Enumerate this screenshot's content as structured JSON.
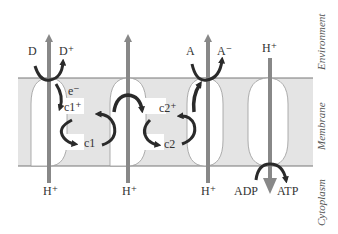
{
  "diagram": {
    "type": "membrane electron transport / proton pumping schematic",
    "regions": {
      "environment": "Environment",
      "membrane": "Membrane",
      "cytoplasm": "Cytoplasm"
    },
    "labels": {
      "d": "D",
      "d_plus": "D⁺",
      "e_minus": "e⁻",
      "c1_plus": "c1⁺",
      "c1": "c1",
      "c2_plus": "c2⁺",
      "c2": "c2",
      "a": "A",
      "a_minus": "A⁻",
      "h_plus_top": "H⁺",
      "h_plus_1": "H⁺",
      "h_plus_2": "H⁺",
      "h_plus_3": "H⁺",
      "adp": "ADP",
      "atp": "ATP"
    },
    "colors": {
      "membrane_fill": "#e4e4e4",
      "arrow_gray": "#888888",
      "curve_dark": "#2a2a2a",
      "line": "#777777"
    }
  }
}
